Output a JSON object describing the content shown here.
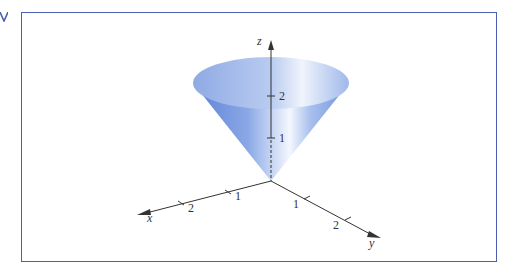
{
  "figure": {
    "frame_color": "#4a5fb0",
    "surface_color": "#7a9de0",
    "axes": {
      "x": {
        "label": "x",
        "ticks": [
          "1",
          "2"
        ]
      },
      "y": {
        "label": "y",
        "ticks": [
          "1",
          "2"
        ]
      },
      "z": {
        "label": "z",
        "ticks": [
          "1",
          "2"
        ]
      }
    }
  }
}
